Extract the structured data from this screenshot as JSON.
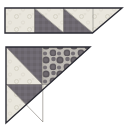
{
  "figure": {
    "title": "Quilt block piecing diagram",
    "background_color": "#ffffff",
    "outline_color": "#2b2b33",
    "units": [
      {
        "name": "top-strip-unit",
        "shape": "right-triangle-strip",
        "label": "Row of three half-square triangle blocks",
        "blocks": [
          {
            "name": "block-1",
            "light_fabric": "cream-dot-print",
            "dark_fabric": "none",
            "orientation": "solid-light"
          },
          {
            "name": "block-2",
            "light_fabric": "cream-dot-print",
            "dark_fabric": "mauve-gray-solid",
            "orientation": "dark-lower-left"
          },
          {
            "name": "block-3",
            "light_fabric": "cream-dot-print",
            "dark_fabric": "mauve-gray-solid",
            "orientation": "dark-lower-left"
          }
        ]
      },
      {
        "name": "bottom-triangle-unit",
        "shape": "large-right-triangle",
        "label": "Four-block right triangle with polka dot fabric",
        "blocks": [
          {
            "name": "block-top-left",
            "light_fabric": "cream-dot-print",
            "dark_fabric": "mauve-gray-solid",
            "orientation": "dark-upper-right"
          },
          {
            "name": "block-top-right",
            "light_fabric": "none",
            "dark_fabric": "charcoal-polka-dot",
            "orientation": "solid-polka-dot"
          },
          {
            "name": "block-bottom-left",
            "light_fabric": "cream-dot-print",
            "dark_fabric": "mauve-gray-solid",
            "orientation": "dark-upper-right"
          },
          {
            "name": "block-bottom-right",
            "light_fabric": "cream-dot-print",
            "dark_fabric": "none",
            "orientation": "solid-light"
          }
        ]
      }
    ],
    "fabrics": [
      {
        "name": "cream-dot-print",
        "color": "#e8e5dc",
        "accent": "#d6d2c6",
        "description": "Light cream with small ring dots"
      },
      {
        "name": "mauve-gray-solid",
        "color": "#6f6a72",
        "accent": "#5d5862",
        "description": "Medium dark mauve gray"
      },
      {
        "name": "charcoal-polka-dot",
        "color": "#b8b4ae",
        "accent": "#555055",
        "description": "Gray ground with large charcoal dots"
      }
    ]
  }
}
